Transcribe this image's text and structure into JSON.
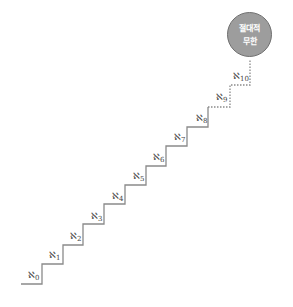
{
  "diagram": {
    "type": "staircase",
    "top_node": {
      "line1": "절대적",
      "line2": "무한"
    },
    "steps": [
      {
        "symbol": "ℵ",
        "sub": "0"
      },
      {
        "symbol": "ℵ",
        "sub": "1"
      },
      {
        "symbol": "ℵ",
        "sub": "2"
      },
      {
        "symbol": "ℵ",
        "sub": "3"
      },
      {
        "symbol": "ℵ",
        "sub": "4"
      },
      {
        "symbol": "ℵ",
        "sub": "5"
      },
      {
        "symbol": "ℵ",
        "sub": "6"
      },
      {
        "symbol": "ℵ",
        "sub": "7"
      },
      {
        "symbol": "ℵ",
        "sub": "8"
      },
      {
        "symbol": "ℵ",
        "sub": "9"
      },
      {
        "symbol": "ℵ",
        "sub": "10"
      }
    ],
    "colors": {
      "line": "#8a8a8a",
      "circle_fill": "#9d9d9d",
      "circle_stroke": "#6f6f6f",
      "label": "#444444"
    }
  }
}
